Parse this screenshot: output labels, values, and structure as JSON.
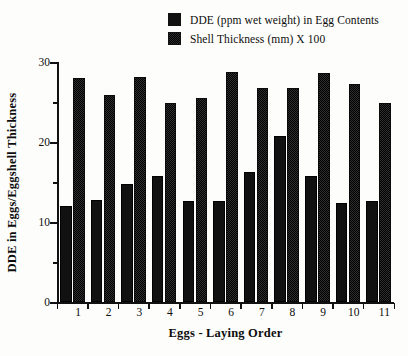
{
  "legend": {
    "items": [
      {
        "label": "DDE (ppm wet weight) in Egg Contents",
        "swatch": "solid-black-square-icon",
        "color": "#111111"
      },
      {
        "label": "Shell Thickness (mm) X 100",
        "swatch": "dithered-gray-square-icon",
        "color": "#2e2e2e"
      }
    ]
  },
  "axes": {
    "ylabel": "DDE in Eggs/Eggshell Thickness",
    "xlabel": "Eggs - Laying Order",
    "yticks": [
      "0",
      "10",
      "20",
      "30"
    ],
    "yminor": [
      "5",
      "15",
      "25"
    ],
    "xticks": [
      "1",
      "2",
      "3",
      "4",
      "5",
      "6",
      "7",
      "8",
      "9",
      "10",
      "11"
    ]
  },
  "chart_data": {
    "type": "bar",
    "title": "",
    "xlabel": "Eggs - Laying Order",
    "ylabel": "DDE in Eggs/Eggshell Thickness",
    "categories": [
      "1",
      "2",
      "3",
      "4",
      "5",
      "6",
      "7",
      "8",
      "9",
      "10",
      "11"
    ],
    "series": [
      {
        "name": "DDE (ppm wet weight) in Egg Contents",
        "color": "#111111",
        "values": [
          12.0,
          12.7,
          14.8,
          15.8,
          12.6,
          12.6,
          16.3,
          20.7,
          15.7,
          12.4,
          12.6
        ]
      },
      {
        "name": "Shell Thickness (mm) X 100",
        "color": "#2e2e2e",
        "values": [
          28.0,
          25.9,
          28.1,
          24.9,
          25.5,
          28.8,
          26.8,
          26.7,
          28.6,
          27.2,
          24.9
        ]
      }
    ],
    "ylim": [
      0,
      30
    ],
    "ytick_step": 10,
    "yminor_step": 5,
    "grid": false,
    "legend_position": "top-center"
  }
}
